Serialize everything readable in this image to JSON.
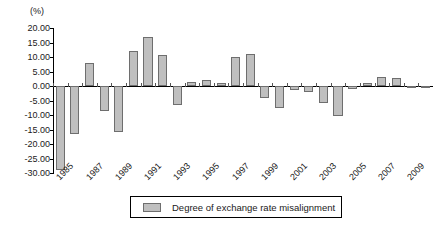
{
  "chart_data": {
    "type": "bar",
    "title": "",
    "unit_label": "(%)",
    "xlabel": "",
    "ylabel": "",
    "ylim": [
      -30,
      20
    ],
    "ytick_step": 5,
    "yticks": [
      "20.00",
      "15.00",
      "10.00",
      "5.00",
      "0.00",
      "-5.00",
      "-10.00",
      "-15.00",
      "-20.00",
      "-25.00",
      "-30.00"
    ],
    "ytick_values": [
      20,
      15,
      10,
      5,
      0,
      -5,
      -10,
      -15,
      -20,
      -25,
      -30
    ],
    "grid": false,
    "legend_position": "bottom-center",
    "legend": [
      "Degree of exchange rate misalignment"
    ],
    "categories": [
      "1985",
      "1986",
      "1987",
      "1988",
      "1989",
      "1990",
      "1991",
      "1992",
      "1993",
      "1994",
      "1995",
      "1996",
      "1997",
      "1998",
      "1999",
      "2000",
      "2001",
      "2002",
      "2003",
      "2004",
      "2005",
      "2006",
      "2007",
      "2008",
      "2009",
      "2010"
    ],
    "xtick_labels": [
      "1985",
      "1987",
      "1989",
      "1991",
      "1993",
      "1995",
      "1997",
      "1999",
      "2001",
      "2003",
      "2005",
      "2007",
      "2009"
    ],
    "series": [
      {
        "name": "Degree of exchange rate misalignment",
        "color": "#bfbfbf",
        "values": [
          -29.0,
          -16.5,
          8.0,
          -8.5,
          -16.0,
          12.0,
          17.0,
          10.7,
          -6.5,
          1.5,
          2.0,
          1.0,
          10.0,
          11.0,
          -4.0,
          -7.5,
          -1.5,
          -2.0,
          -6.0,
          -10.5,
          -1.0,
          1.0,
          3.0,
          2.8,
          -0.5,
          -0.3
        ]
      }
    ]
  },
  "legend": {
    "label": "Degree of exchange rate misalignment"
  }
}
